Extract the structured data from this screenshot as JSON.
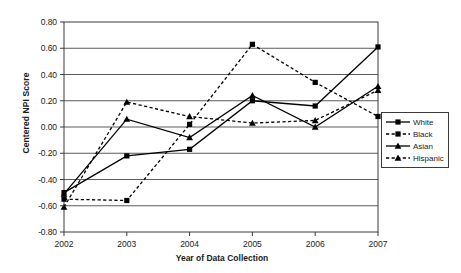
{
  "chart_data": {
    "type": "line",
    "title": "",
    "xlabel": "Year of Data Collection",
    "ylabel": "Centered NPI Score",
    "categories": [
      "2002",
      "2003",
      "2004",
      "2005",
      "2006",
      "2007"
    ],
    "x": [
      2002,
      2003,
      2004,
      2005,
      2006,
      2007
    ],
    "ylim": [
      -0.8,
      0.8
    ],
    "xlim": [
      2002,
      2007
    ],
    "yticks": [
      "-0.80",
      "-0.60",
      "-0.40",
      "-0.20",
      "0.00",
      "0.20",
      "0.40",
      "0.60",
      "0.80"
    ],
    "ytick_values": [
      -0.8,
      -0.6,
      -0.4,
      -0.2,
      0.0,
      0.2,
      0.4,
      0.6,
      0.8
    ],
    "grid": true,
    "grid_axis": "y",
    "legend_position": "right",
    "series": [
      {
        "name": "White",
        "values": [
          -0.5,
          -0.22,
          -0.17,
          0.2,
          0.16,
          0.61
        ],
        "line": "solid",
        "marker": "square",
        "color": "#000000"
      },
      {
        "name": "Black",
        "values": [
          -0.55,
          -0.56,
          0.02,
          0.63,
          0.34,
          0.08
        ],
        "line": "dashed",
        "marker": "square",
        "color": "#000000"
      },
      {
        "name": "Asian",
        "values": [
          -0.51,
          0.06,
          -0.08,
          0.24,
          0.0,
          0.31
        ],
        "line": "solid",
        "marker": "triangle",
        "color": "#000000"
      },
      {
        "name": "Hispanic",
        "values": [
          -0.61,
          0.19,
          0.08,
          0.03,
          0.05,
          0.28
        ],
        "line": "dashed",
        "marker": "triangle",
        "color": "#000000"
      }
    ]
  },
  "legend": {
    "items": [
      {
        "label": "White"
      },
      {
        "label": "Black"
      },
      {
        "label": "Asian"
      },
      {
        "label": "Hispanic"
      }
    ]
  },
  "axes": {
    "y_title": "Centered NPI Score",
    "x_title": "Year of Data Collection"
  }
}
